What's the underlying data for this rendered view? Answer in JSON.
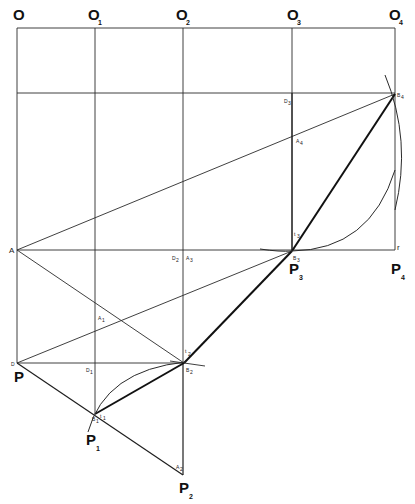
{
  "diagram": {
    "type": "geometric-construction",
    "colors": {
      "line": "#1e1e1e",
      "background": "#ffffff"
    },
    "top_labels": [
      {
        "main": "O",
        "sub": ""
      },
      {
        "main": "O",
        "sub": "1"
      },
      {
        "main": "O",
        "sub": "2"
      },
      {
        "main": "O",
        "sub": "3"
      },
      {
        "main": "O",
        "sub": "4"
      }
    ],
    "bottom_labels": {
      "P": {
        "main": "P",
        "sub": ""
      },
      "P1": {
        "main": "P",
        "sub": "1"
      },
      "P2": {
        "main": "P",
        "sub": "2"
      },
      "P3": {
        "main": "P",
        "sub": "3"
      },
      "P4": {
        "main": "P",
        "sub": "4"
      }
    },
    "point_labels": {
      "A": "A",
      "D": "D",
      "D1": "D",
      "D1_sub": "1",
      "D2": "D",
      "D2_sub": "2",
      "D3": "D",
      "D3_sub": "3",
      "A1": "A",
      "A1_sub": "1",
      "A2": "A",
      "A2_sub": "2",
      "A3": "A",
      "A3_sub": "3",
      "A4": "A",
      "A4_sub": "4",
      "B1": "B",
      "B1_sub": "1",
      "B2": "B",
      "B2_sub": "2",
      "B3": "B",
      "B3_sub": "3",
      "B4": "B",
      "B4_sub": "4",
      "t1": "t",
      "t1_sub": "1",
      "t2": "t",
      "t2_sub": "2",
      "t3": "t",
      "t3_sub": "3",
      "r": "r"
    }
  }
}
